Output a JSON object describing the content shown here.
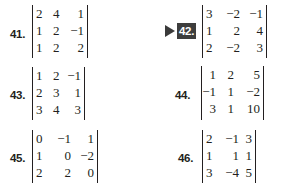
{
  "problems": [
    {
      "number": "41.",
      "highlighted": false,
      "matrix": [
        [
          "2",
          "4",
          "1"
        ],
        [
          "1",
          "2",
          "−1"
        ],
        [
          "1",
          "2",
          "2"
        ]
      ]
    },
    {
      "number": "42.",
      "highlighted": true,
      "matrix": [
        [
          "3",
          "−2",
          "−1"
        ],
        [
          "1",
          "2",
          "4"
        ],
        [
          "2",
          "−2",
          "3"
        ]
      ]
    },
    {
      "number": "43.",
      "highlighted": false,
      "matrix": [
        [
          "1",
          "2",
          "−1"
        ],
        [
          "2",
          "3",
          "1"
        ],
        [
          "3",
          "4",
          "3"
        ]
      ]
    },
    {
      "number": "44.",
      "highlighted": false,
      "matrix": [
        [
          "1",
          "2",
          "5"
        ],
        [
          "−1",
          "1",
          "−2"
        ],
        [
          "3",
          "1",
          "10"
        ]
      ]
    },
    {
      "number": "45.",
      "highlighted": false,
      "matrix": [
        [
          "0",
          "−1",
          "1"
        ],
        [
          "1",
          "0",
          "−2"
        ],
        [
          "2",
          "2",
          "0"
        ]
      ]
    },
    {
      "number": "46.",
      "highlighted": false,
      "matrix": [
        [
          "2",
          "−1",
          "3"
        ],
        [
          "1",
          "1",
          "1"
        ],
        [
          "3",
          "−4",
          "5"
        ]
      ]
    }
  ],
  "colors": {
    "text": "#231f20",
    "badge_bg": "#3d3d3d",
    "badge_text": "#ffffff",
    "arrow": "#3a3a3a"
  }
}
